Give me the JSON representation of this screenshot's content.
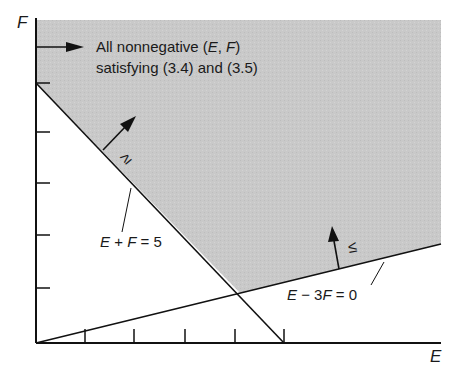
{
  "diagram": {
    "axes": {
      "x_label": "E",
      "y_label": "F",
      "x_ticks": 5,
      "y_ticks": 5
    },
    "region": {
      "label_line1": "All nonnegative (",
      "label_E": "E",
      "label_comma": ", ",
      "label_F": "F",
      "label_close": ")",
      "label_line2": "satisfying (3.4) and (3.5)",
      "fill_color": "#c8c8c8"
    },
    "constraints": [
      {
        "lhs_E": "E",
        "op": " + ",
        "lhs_F": "F",
        "rhs": " = 5",
        "inequality": "≥"
      },
      {
        "lhs_E": "E",
        "op": " − 3",
        "lhs_F": "F",
        "rhs": " = 0",
        "inequality": "≤"
      }
    ]
  }
}
